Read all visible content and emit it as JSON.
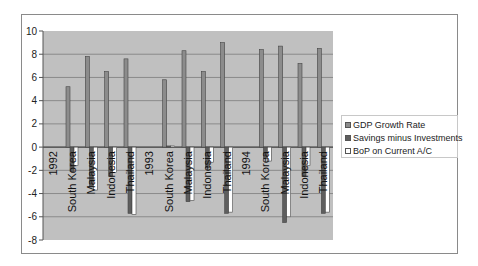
{
  "chart_data": {
    "type": "bar",
    "title": "",
    "xlabel": "",
    "ylabel": "",
    "ylim": [
      -8,
      10
    ],
    "yticks": [
      10,
      8,
      6,
      4,
      2,
      0,
      -2,
      -4,
      -6,
      -8
    ],
    "grid": true,
    "legend_position": "right",
    "categories": [
      "1992",
      "South Korea",
      "Malaysia",
      "Indonesia",
      "Thailand",
      "1993",
      "South Korea",
      "Malaysia",
      "Indonesia",
      "Thailand",
      "1994",
      "South Korea",
      "Malaysia",
      "Indonesia",
      "Thailand"
    ],
    "series": [
      {
        "name": "GDP Growth Rate",
        "color": "#8c8c8c",
        "values": [
          null,
          5.2,
          7.8,
          6.5,
          7.6,
          null,
          5.8,
          8.3,
          6.5,
          9.0,
          null,
          8.4,
          8.7,
          7.2,
          8.5
        ]
      },
      {
        "name": "Savings minus Investments",
        "color": "#5e5e5e",
        "values": [
          null,
          -2.1,
          -3.4,
          -2.5,
          -5.7,
          null,
          0.1,
          -4.7,
          -1.8,
          -5.7,
          null,
          -1.0,
          -6.5,
          -2.5,
          -5.7
        ]
      },
      {
        "name": "BoP on Current A/C",
        "color": "#ffffff",
        "values": [
          null,
          -1.6,
          -3.7,
          -2.2,
          -5.8,
          null,
          0.1,
          -4.6,
          -1.3,
          -5.6,
          null,
          -1.2,
          -6.0,
          -1.6,
          -5.6
        ]
      }
    ]
  },
  "legend": {
    "items": [
      {
        "label": "GDP Growth Rate"
      },
      {
        "label": "Savings minus Investments"
      },
      {
        "label": "BoP on Current A/C"
      }
    ]
  }
}
